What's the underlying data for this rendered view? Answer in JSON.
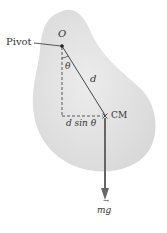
{
  "diagram": {
    "pivot_label": "Pivot",
    "origin_label": "O",
    "angle_label": "θ",
    "distance_label": "d",
    "lever_arm_label": "d sin θ",
    "cm_label": "CM",
    "force_label": "mg",
    "colors": {
      "body_fill": "#e3e3e3",
      "line": "#333333",
      "arrow": "#555555",
      "background": "#ffffff"
    }
  }
}
